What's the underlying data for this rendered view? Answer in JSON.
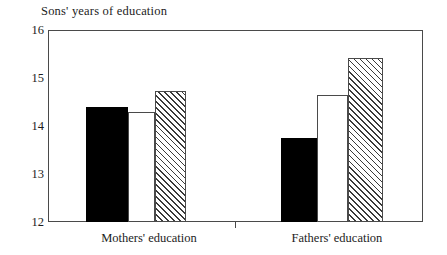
{
  "chart_data": {
    "type": "bar",
    "title": "Sons' years of education",
    "xlabel": "",
    "ylabel": "",
    "ylim": [
      12,
      16
    ],
    "yticks": [
      12,
      13,
      14,
      15,
      16
    ],
    "ytick_labels": [
      "12",
      "13",
      "14",
      "15",
      "16"
    ],
    "grid": false,
    "legend": "none",
    "categories": [
      "Mothers' education",
      "Fathers' education"
    ],
    "series": [
      {
        "name": "series-1-solid",
        "style": "solid-black",
        "values": [
          14.4,
          13.75
        ]
      },
      {
        "name": "series-2-hollow",
        "style": "hollow-white",
        "values": [
          14.3,
          14.65
        ]
      },
      {
        "name": "series-3-hatched",
        "style": "diagonal-hatched",
        "values": [
          14.73,
          15.42
        ]
      }
    ]
  },
  "axis": {
    "y_labels": {
      "t16": "16",
      "t15": "15",
      "t14": "14",
      "t13": "13",
      "t12": "12"
    }
  },
  "colors": {
    "frame": "#4a4a4a",
    "solid_fill": "#000000",
    "hollow_fill": "#ffffff",
    "hatch_line": "#3a3a3a",
    "text": "#1c1c1c",
    "background": "#ffffff"
  }
}
